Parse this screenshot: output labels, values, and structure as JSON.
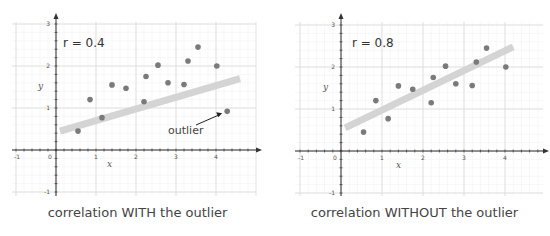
{
  "chart_data": [
    {
      "type": "scatter",
      "title": "correlation WITH the outlier",
      "annotation": "r = 0.4",
      "outlier_label": "outlier",
      "xlabel": "x",
      "ylabel": "y",
      "xlim": [
        -1,
        5
      ],
      "ylim": [
        -1,
        3
      ],
      "xticks": [
        "-1",
        "0",
        "1",
        "2",
        "3",
        "4"
      ],
      "yticks": [
        "-1",
        "1",
        "2",
        "3"
      ],
      "grid": true,
      "points": [
        [
          0.55,
          0.45
        ],
        [
          0.85,
          1.2
        ],
        [
          1.15,
          0.77
        ],
        [
          1.4,
          1.55
        ],
        [
          1.75,
          1.47
        ],
        [
          2.2,
          1.15
        ],
        [
          2.25,
          1.75
        ],
        [
          2.55,
          2.02
        ],
        [
          2.8,
          1.6
        ],
        [
          3.2,
          1.56
        ],
        [
          3.3,
          2.12
        ],
        [
          3.55,
          2.45
        ],
        [
          4.02,
          2.0
        ],
        [
          4.28,
          0.92
        ]
      ],
      "outlier": [
        4.28,
        0.92
      ],
      "trendline": {
        "x": [
          0.1,
          4.6
        ],
        "y": [
          0.45,
          1.7
        ]
      }
    },
    {
      "type": "scatter",
      "title": "correlation WITHOUT the outlier",
      "annotation": "r = 0.8",
      "xlabel": "x",
      "ylabel": "y",
      "xlim": [
        -1,
        5
      ],
      "ylim": [
        -1,
        3
      ],
      "xticks": [
        "-1",
        "0",
        "1",
        "2",
        "3",
        "4"
      ],
      "yticks": [
        "-1",
        "1",
        "2",
        "3"
      ],
      "grid": true,
      "points": [
        [
          0.55,
          0.45
        ],
        [
          0.85,
          1.2
        ],
        [
          1.15,
          0.77
        ],
        [
          1.4,
          1.55
        ],
        [
          1.75,
          1.47
        ],
        [
          2.2,
          1.15
        ],
        [
          2.25,
          1.75
        ],
        [
          2.55,
          2.02
        ],
        [
          2.8,
          1.6
        ],
        [
          3.2,
          1.56
        ],
        [
          3.3,
          2.12
        ],
        [
          3.55,
          2.45
        ],
        [
          4.02,
          2.0
        ]
      ],
      "trendline": {
        "x": [
          0.1,
          4.2
        ],
        "y": [
          0.55,
          2.48
        ]
      }
    }
  ],
  "colors": {
    "point": "#7a7a7a",
    "trendline": "#d4d4d4",
    "grid": "#e4e4e4",
    "axis": "#333333"
  }
}
